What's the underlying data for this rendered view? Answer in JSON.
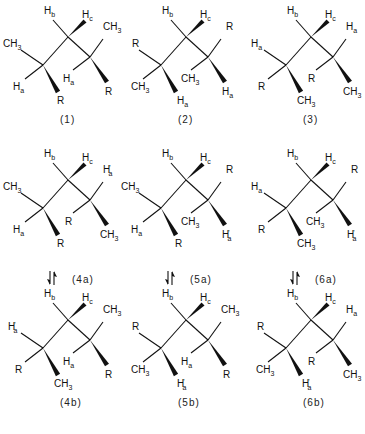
{
  "figure": {
    "molecules": [
      {
        "id": "1",
        "caption": "(1)",
        "col": 0,
        "row": 0,
        "left_upper": "CH3",
        "left_lower": "Ha",
        "left_wedge": "R",
        "right_upper": "CH3",
        "right_mid": "Ha",
        "right_wedge": "R",
        "arrow_below": false
      },
      {
        "id": "2",
        "caption": "(2)",
        "col": 1,
        "row": 0,
        "left_upper": "R",
        "left_lower": "CH3",
        "left_wedge": "Ha",
        "right_upper": "R",
        "right_mid": "CH3",
        "right_wedge": "Ha",
        "arrow_below": false
      },
      {
        "id": "3",
        "caption": "(3)",
        "col": 2,
        "row": 0,
        "left_upper": "Ha",
        "left_lower": "R",
        "left_wedge": "CH3",
        "right_upper": "Ha",
        "right_mid": "R",
        "right_wedge": "CH3",
        "arrow_below": false
      },
      {
        "id": "4a",
        "caption": "(4a)",
        "col": 0,
        "row": 1,
        "left_upper": "CH3",
        "left_lower": "Ha",
        "left_wedge": "R",
        "right_upper": "H'a",
        "right_mid": "R",
        "right_wedge": "CH3",
        "arrow_below": true
      },
      {
        "id": "5a",
        "caption": "(5a)",
        "col": 1,
        "row": 1,
        "left_upper": "CH3",
        "left_lower": "Ha",
        "left_wedge": "R",
        "right_upper": "R",
        "right_mid": "CH3",
        "right_wedge": "H'a",
        "arrow_below": true
      },
      {
        "id": "6a",
        "caption": "(6a)",
        "col": 2,
        "row": 1,
        "left_upper": "Ha",
        "left_lower": "R",
        "left_wedge": "CH3",
        "right_upper": "R",
        "right_mid": "CH3",
        "right_wedge": "H'a",
        "arrow_below": true
      },
      {
        "id": "4b",
        "caption": "(4b)",
        "col": 0,
        "row": 2,
        "left_upper": "H'a",
        "left_lower": "R",
        "left_wedge": "CH3",
        "right_upper": "CH3",
        "right_mid": "Ha",
        "right_wedge": "R",
        "arrow_below": false
      },
      {
        "id": "5b",
        "caption": "(5b)",
        "col": 1,
        "row": 2,
        "left_upper": "R",
        "left_lower": "CH3",
        "left_wedge": "H'a",
        "right_upper": "CH3",
        "right_mid": "Ha",
        "right_wedge": "R",
        "arrow_below": false
      },
      {
        "id": "6b",
        "caption": "(6b)",
        "col": 2,
        "row": 2,
        "left_upper": "R",
        "left_lower": "CH3",
        "left_wedge": "H'a",
        "right_upper": "Ha",
        "right_mid": "R",
        "right_wedge": "CH3",
        "arrow_below": false
      }
    ],
    "central_labels": {
      "top": "Hb",
      "wedge": "Hc"
    },
    "equilibrium_arrow": "⇅"
  }
}
